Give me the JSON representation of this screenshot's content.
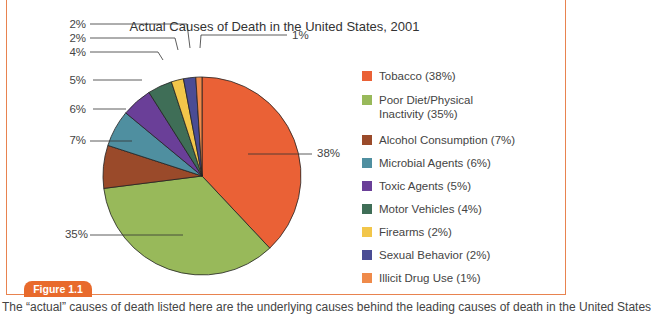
{
  "figure": {
    "tab_label": "Figure 1.1",
    "caption": "The “actual” causes of death listed here are the underlying causes behind the leading causes of death in the United States"
  },
  "chart_data": {
    "type": "pie",
    "title": "Actual Causes of Death in the United States, 2001",
    "categories": [
      "Tobacco",
      "Poor Diet/Physical Inactivity",
      "Alcohol Consumption",
      "Microbial Agents",
      "Toxic Agents",
      "Motor Vehicles",
      "Firearms",
      "Sexual Behavior",
      "Illicit Drug Use"
    ],
    "values": [
      38,
      35,
      7,
      6,
      5,
      4,
      2,
      2,
      1
    ],
    "unit": "%",
    "colors": [
      "#ea6136",
      "#98b95a",
      "#9a4a2a",
      "#4f8fa0",
      "#6a3f98",
      "#3f6e57",
      "#f2c64a",
      "#4a4c94",
      "#ef8a4a"
    ],
    "legend_position": "right",
    "slice_labels": [
      "38%",
      "35%",
      "7%",
      "6%",
      "5%",
      "4%",
      "2%",
      "2%",
      "1%"
    ]
  },
  "legend": {
    "items": [
      {
        "label": "Tobacco (38%)"
      },
      {
        "label": "Poor Diet/Physical",
        "label2": "Inactivity (35%)"
      },
      {
        "label": "Alcohol Consumption (7%)"
      },
      {
        "label": "Microbial Agents (6%)"
      },
      {
        "label": "Toxic Agents (5%)"
      },
      {
        "label": "Motor Vehicles (4%)"
      },
      {
        "label": "Firearms (2%)"
      },
      {
        "label": "Sexual Behavior (2%)"
      },
      {
        "label": "Illicit Drug Use (1%)"
      }
    ]
  }
}
